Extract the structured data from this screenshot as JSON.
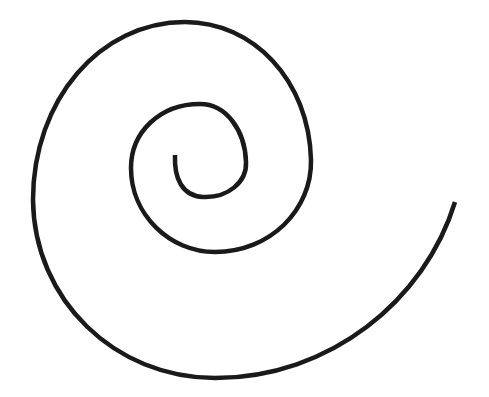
{
  "diagram": {
    "title": "",
    "shape": "spiral",
    "stroke_color": "#1a1a1a",
    "background": "#ffffff",
    "stroke_width": 4.5,
    "start_point": [
      175,
      155
    ],
    "end_point": [
      455,
      202
    ],
    "turns": 2
  }
}
